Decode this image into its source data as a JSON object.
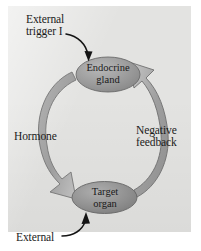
{
  "diagram": {
    "type": "cycle-diagram",
    "panel_color": "#e3e3e1",
    "page_background": "#ffffff",
    "nodes": [
      {
        "id": "endocrine-gland",
        "label": "Endocrine\ngland",
        "shape": "ellipse",
        "fill": "#9a9a9a",
        "text_color": "#1a1a1a",
        "position": "top-center"
      },
      {
        "id": "target-organ",
        "label": "Target\norgan",
        "shape": "ellipse",
        "fill": "#8f8f8f",
        "text_color": "#1a1a1a",
        "position": "bottom-center"
      }
    ],
    "arrows": [
      {
        "id": "hormone-arrow",
        "label": "Hormone",
        "from": "endocrine-gland",
        "to": "target-organ",
        "style": "thick-curved-block",
        "side": "left",
        "fill": "#a8a8a8",
        "stroke": "#6e6e6e"
      },
      {
        "id": "negative-feedback-arrow",
        "label": "Negative\nfeedback",
        "from": "target-organ",
        "to": "endocrine-gland",
        "style": "thick-curved-block",
        "side": "right",
        "fill": "#a8a8a8",
        "stroke": "#6e6e6e"
      },
      {
        "id": "external-trigger-arrow",
        "label": "External\ntrigger I",
        "to": "endocrine-gland",
        "style": "thin-curved-line",
        "position": "top-left",
        "color": "#141414"
      },
      {
        "id": "external-arrow",
        "label": "External",
        "to": "target-organ",
        "style": "thin-curved-line",
        "position": "bottom-left",
        "color": "#141414"
      }
    ],
    "labels": {
      "external_trigger": "External\ntrigger I",
      "hormone": "Hormone",
      "negative_feedback": "Negative\nfeedback",
      "external": "External",
      "endocrine_gland": "Endocrine\ngland",
      "target_organ": "Target\norgan"
    }
  }
}
